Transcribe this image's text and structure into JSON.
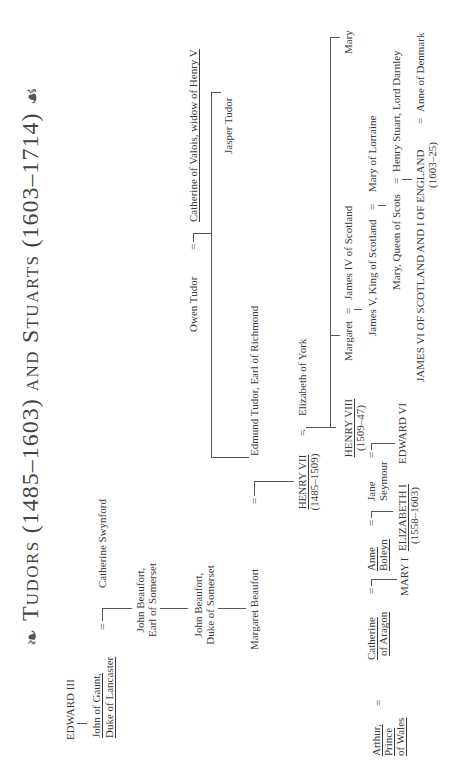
{
  "title": {
    "ornament_left": "❧",
    "part1_initial": "T",
    "part1_rest": "UDORS",
    "part1_dates": " (1485–1603) ",
    "and": "AND",
    "part2_initial": " S",
    "part2_rest": "TUARTS",
    "part2_dates": " (1603–1714) ",
    "ornament_right": "☙"
  },
  "people": {
    "edward_iii": "EDWARD III",
    "john_of_gaunt_1": "John of Gaunt,",
    "john_of_gaunt_2": "Duke of Lancaster",
    "catherine_swynford": "Catherine Swynford",
    "john_beaufort_earl_1": "John Beaufort,",
    "john_beaufort_earl_2": "Earl of Somerset",
    "john_beaufort_duke_1": "John Beaufort,",
    "john_beaufort_duke_2": "Duke of Somerset",
    "margaret_beaufort": "Margaret Beaufort",
    "edmund_tudor": "Edmund Tudor, Earl of Richmond",
    "owen_tudor": "Owen Tudor",
    "catherine_of_valois": "Catherine of Valois, widow of Henry V",
    "jasper_tudor": "Jasper Tudor",
    "henry_vii": "HENRY VII",
    "henry_vii_dates": "(1485–1509)",
    "elizabeth_of_york": "Elizabeth of York",
    "arthur_1": "Arthur,",
    "arthur_2": "Prince",
    "arthur_3": "of Wales",
    "catherine_aragon_1": "Catherine",
    "catherine_aragon_2": "of Aragon",
    "anne_boleyn_1": "Anne",
    "anne_boleyn_2": "Boleyn",
    "jane_seymour_1": "Jane",
    "jane_seymour_2": "Seymour",
    "henry_viii": "HENRY VIII",
    "henry_viii_dates": "(1509–47)",
    "mary_i": "MARY I",
    "elizabeth_i": "ELIZABETH I",
    "elizabeth_i_dates": "(1558–1603)",
    "edward_vi": "EDWARD VI",
    "margaret": "Margaret",
    "james_iv": "James IV of Scotland",
    "mary_tudor": "Mary",
    "james_v": "James V, King of Scotland",
    "mary_of_lorraine": "Mary of Lorraine",
    "mary_queen_of_scots": "Mary, Queen of Scots",
    "henry_stuart": "Henry Stuart, Lord Darnley",
    "james_vi": "JAMES VI OF SCOTLAND AND I OF ENGLAND",
    "anne_of_denmark": "Anne of Denmark",
    "james_vi_dates": "(1603–25)"
  },
  "symbols": {
    "marriage": "="
  }
}
